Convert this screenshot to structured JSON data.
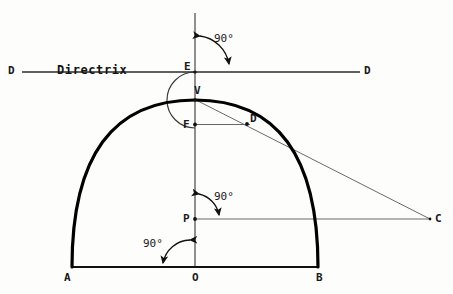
{
  "figure": {
    "background_color": "#fdfdfc",
    "ink_color": "#1a1a1a",
    "curve_color": "#000000"
  },
  "labels": {
    "directrix_text": "Directrix",
    "directrix_left": "D",
    "directrix_right": "D",
    "point_E": "E",
    "point_V": "V",
    "point_F": "F",
    "point_D": "D",
    "point_P": "P",
    "point_C": "C",
    "point_A": "A",
    "point_O": "O",
    "point_B": "B",
    "angle_top": "90°",
    "angle_middle": "90°",
    "angle_bottom": "90°"
  },
  "geometry": {
    "points": {
      "A": {
        "x": 72,
        "y": 267
      },
      "B": {
        "x": 318,
        "y": 267
      },
      "O": {
        "x": 195,
        "y": 267
      },
      "V": {
        "x": 195,
        "y": 100
      },
      "E": {
        "x": 195,
        "y": 72
      },
      "F": {
        "x": 195,
        "y": 128
      },
      "P": {
        "x": 195,
        "y": 219
      },
      "C": {
        "x": 430,
        "y": 219
      },
      "D": {
        "x": 247,
        "y": 124
      }
    },
    "axis_vertical": {
      "x": 195,
      "y_top": 13,
      "y_bottom": 267
    },
    "directrix_line": {
      "y": 72,
      "x_start": 22,
      "x_end": 360
    },
    "baseline": {
      "y": 267,
      "x_start": 72,
      "x_end": 318
    },
    "arc_EF": {
      "center_x": 195,
      "center_y": 100,
      "radius": 28,
      "bulge": "left"
    },
    "parabola": {
      "vertex_x": 195,
      "vertex_y": 100,
      "left_x": 72,
      "right_x": 318,
      "base_y": 267,
      "stroke_width": 3
    }
  },
  "annotations": [
    {
      "name": "angle-top",
      "label": "90°",
      "text_x": 214,
      "text_y": 33
    },
    {
      "name": "angle-middle",
      "label": "90°",
      "text_x": 214,
      "text_y": 191
    },
    {
      "name": "angle-bottom",
      "label": "90°",
      "text_x": 146,
      "text_y": 238
    }
  ]
}
